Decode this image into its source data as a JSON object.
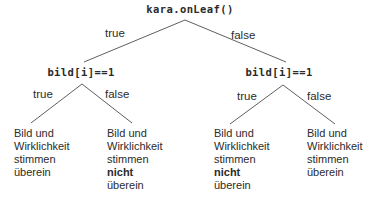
{
  "diagram": {
    "root": {
      "label": "kara.onLeaf()"
    },
    "root_branches": {
      "true_label": "true",
      "false_label": "false"
    },
    "left_condition": {
      "label": "bild[i]==1"
    },
    "right_condition": {
      "label": "bild[i]==1"
    },
    "left_branches": {
      "true_label": "true",
      "false_label": "false"
    },
    "right_branches": {
      "true_label": "true",
      "false_label": "false"
    },
    "leaves": [
      {
        "l1": "Bild und",
        "l2": "Wirklichkeit",
        "l3": "stimmen",
        "l4": "überein"
      },
      {
        "l1": "Bild und",
        "l2": "Wirklichkeit",
        "l3": "stimmen",
        "l4_bold": "nicht",
        "l5": "überein"
      },
      {
        "l1": "Bild und",
        "l2": "Wirklichkeit",
        "l3": "stimmen",
        "l4_bold": "nicht",
        "l5": "überein"
      },
      {
        "l1": "Bild und",
        "l2": "Wirklichkeit",
        "l3": "stimmen",
        "l4": "überein"
      }
    ],
    "colors": {
      "text": "#2b2b2b",
      "edge": "#5f5f5f",
      "background": "#ffffff"
    }
  }
}
